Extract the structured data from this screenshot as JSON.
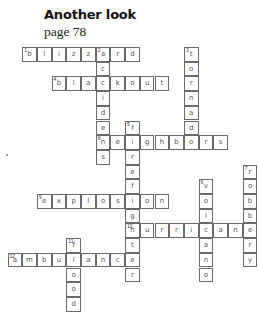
{
  "header": {
    "title": "Another look",
    "subtitle": "page 78"
  },
  "grid": {
    "origin_x": 7.5,
    "origin_y": 47,
    "cell": 14.7,
    "entries": [
      {
        "number": "1",
        "dir": "across",
        "row": 0,
        "col": 1,
        "letters": [
          "b",
          "l",
          "i",
          "z",
          "z",
          "a",
          "r",
          "d"
        ]
      },
      {
        "number": "2",
        "dir": "down",
        "row": 0,
        "col": 6,
        "letters": [
          "a",
          "c",
          "c",
          "i",
          "d",
          "e",
          "n",
          "s"
        ]
      },
      {
        "number": "3",
        "dir": "down",
        "row": 0,
        "col": 12,
        "letters": [
          "t",
          "o",
          "r",
          "n",
          "a",
          "d",
          "o"
        ]
      },
      {
        "number": "4",
        "dir": "across",
        "row": 2,
        "col": 3,
        "letters": [
          "b",
          "l",
          "a",
          "c",
          "k",
          "o",
          "u",
          "t"
        ]
      },
      {
        "number": "5",
        "dir": "down",
        "row": 5,
        "col": 8,
        "letters": [
          "f",
          "i",
          "r",
          "e",
          "f",
          "i",
          "g",
          "h",
          "t",
          "e",
          "r"
        ]
      },
      {
        "number": "",
        "dir": "across",
        "row": 6,
        "col": 6,
        "letters": [
          "n",
          "e",
          "i",
          "g",
          "h",
          "b",
          "o",
          "r",
          "s"
        ]
      },
      {
        "number": "6",
        "dir": "down",
        "row": 9,
        "col": 13,
        "letters": [
          "v",
          "o",
          "l",
          "c",
          "a",
          "n",
          "o"
        ]
      },
      {
        "number": "7",
        "dir": "down",
        "row": 8,
        "col": 16,
        "letters": [
          "r",
          "o",
          "b",
          "b",
          "e",
          "r",
          "y"
        ]
      },
      {
        "number": "9",
        "dir": "across",
        "row": 10,
        "col": 2,
        "letters": [
          "e",
          "x",
          "p",
          "l",
          "o",
          "s",
          "i",
          "o",
          "n"
        ]
      },
      {
        "number": "10",
        "dir": "across",
        "row": 12,
        "col": 8,
        "letters": [
          "h",
          "u",
          "r",
          "r",
          "i",
          "c",
          "a",
          "n",
          "e"
        ]
      },
      {
        "number": "11",
        "dir": "down",
        "row": 13,
        "col": 4,
        "letters": [
          "f",
          "l",
          "o",
          "o",
          "d"
        ]
      },
      {
        "number": "12",
        "dir": "across",
        "row": 14,
        "col": 0,
        "letters": [
          "a",
          "m",
          "b",
          "u",
          "l",
          "a",
          "n",
          "c",
          "e"
        ]
      }
    ],
    "start_numbers": [
      {
        "number": "1",
        "row": 0,
        "col": 1
      },
      {
        "number": "2",
        "row": 0,
        "col": 6
      },
      {
        "number": "3",
        "row": 0,
        "col": 12
      },
      {
        "number": "4",
        "row": 2,
        "col": 3
      },
      {
        "number": "5",
        "row": 5,
        "col": 8
      },
      {
        "number": "8",
        "row": 6,
        "col": 6
      },
      {
        "number": "6",
        "row": 9,
        "col": 13
      },
      {
        "number": "7",
        "row": 8,
        "col": 16
      },
      {
        "number": "9",
        "row": 10,
        "col": 2
      },
      {
        "number": "10",
        "row": 12,
        "col": 8
      },
      {
        "number": "11",
        "row": 13,
        "col": 4
      },
      {
        "number": "12",
        "row": 14,
        "col": 0
      }
    ]
  }
}
